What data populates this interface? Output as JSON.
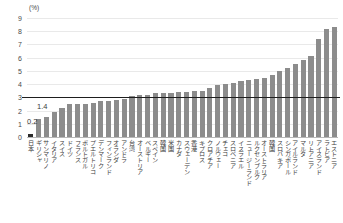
{
  "unit_label": "(%)",
  "y_ticks": [
    "0",
    "1",
    "2",
    "3",
    "4",
    "5",
    "6",
    "7",
    "8",
    "9"
  ],
  "value_callouts": {
    "japan": "0.2",
    "greece": "1.4"
  },
  "chart_data": {
    "type": "bar",
    "title": "",
    "subtitle": "",
    "xlabel": "",
    "ylabel": "(%)",
    "ylim": [
      0,
      9
    ],
    "yticks": [
      0,
      1,
      2,
      3,
      4,
      5,
      6,
      7,
      8,
      9
    ],
    "grid": true,
    "legend": "none",
    "bar_color": "#8c8c8c",
    "highlight_color": "#2b2b2b",
    "highlight_index": 0,
    "reference_line": {
      "value": 3.0,
      "color": "#1e1e1e",
      "label": ""
    },
    "categories": [
      "日本",
      "ギリシャ",
      "サンマリノ",
      "イタリア",
      "スイス",
      "ドイツ",
      "フランス",
      "ポルトガル",
      "プエルトリコ",
      "デンマーク",
      "フィンランド",
      "オランダ",
      "アンドラ",
      "台湾",
      "オーストリア",
      "ベルギー",
      "スペイン",
      "韓国",
      "米国",
      "カナダ",
      "スウェーデン",
      "香港",
      "キプロス",
      "クロアチア",
      "ノルウェー",
      "チェコ",
      "スロベニア",
      "イスラエル",
      "ニュージーランド",
      "ルクセンブルク",
      "オーストラリア",
      "韓国",
      "スロバキア",
      "シンガポール",
      "アイルランド",
      "マルタ",
      "リトアニア",
      "アイスランド",
      "ラトビア",
      "エストニア"
    ],
    "values": [
      0.2,
      1.4,
      1.5,
      1.9,
      2.2,
      2.5,
      2.5,
      2.5,
      2.6,
      2.7,
      2.7,
      2.8,
      2.9,
      3.1,
      3.2,
      3.2,
      3.3,
      3.3,
      3.3,
      3.4,
      3.4,
      3.5,
      3.5,
      3.7,
      3.9,
      4.0,
      4.1,
      4.2,
      4.3,
      4.4,
      4.5,
      4.7,
      5.0,
      5.2,
      5.5,
      5.8,
      6.1,
      7.4,
      8.2,
      8.3
    ]
  }
}
